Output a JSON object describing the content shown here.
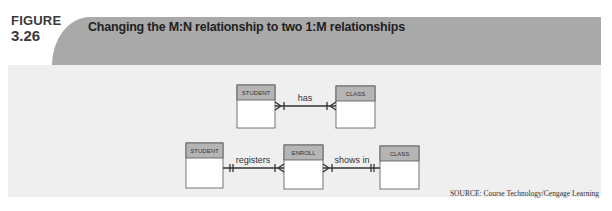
{
  "figure": {
    "label_word": "FIGURE",
    "label_number": "3.26",
    "title": "Changing the M:N relationship to two 1:M relationships",
    "source": "SOURCE: Course Technology/Cengage Learning"
  },
  "colors": {
    "header_band": "#a9a9a9",
    "panel": "#efefef",
    "entity_header": "#b5b5b5",
    "entity_body": "#ffffff",
    "line": "#333333"
  },
  "diagram": {
    "top": {
      "entities": [
        {
          "name": "STUDENT"
        },
        {
          "name": "CLASS"
        }
      ],
      "relationships": [
        {
          "label": "has",
          "from": "STUDENT",
          "to": "CLASS",
          "from_cardinality": "many",
          "to_cardinality": "many"
        }
      ]
    },
    "bottom": {
      "entities": [
        {
          "name": "STUDENT"
        },
        {
          "name": "ENROLL"
        },
        {
          "name": "CLASS"
        }
      ],
      "relationships": [
        {
          "label": "registers",
          "from": "STUDENT",
          "to": "ENROLL",
          "from_cardinality": "one",
          "to_cardinality": "many"
        },
        {
          "label": "shows in",
          "from": "ENROLL",
          "to": "CLASS",
          "from_cardinality": "many",
          "to_cardinality": "one"
        }
      ]
    }
  }
}
